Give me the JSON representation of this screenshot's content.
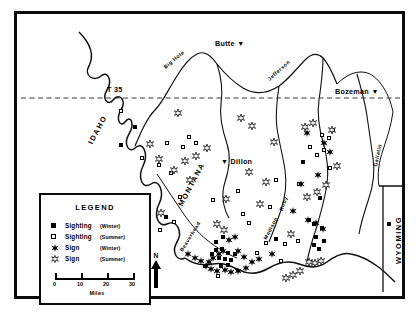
{
  "figure": {
    "type": "distribution-map",
    "region": "Southwestern Montana",
    "border_color": "#0b0b0b",
    "background_color": "#ffffff"
  },
  "cities": [
    {
      "name": "Butte",
      "marker": "triangle-down",
      "x": 212,
      "y": 38,
      "label_side": "left"
    },
    {
      "name": "Bozeman",
      "marker": "triangle-down",
      "x": 330,
      "y": 86,
      "label_side": "left"
    },
    {
      "name": "Dillon",
      "marker": "triangle-down",
      "x": 213,
      "y": 156,
      "label_side": "right"
    }
  ],
  "state_labels": [
    {
      "name": "IDAHO",
      "x": 74,
      "y": 140,
      "rotation": -62
    },
    {
      "name": "MONTANA",
      "x": 168,
      "y": 200,
      "rotation": -62
    },
    {
      "name": "WYOMING",
      "x": 382,
      "y": 205,
      "rotation": -90
    }
  ],
  "river_labels": [
    {
      "name": "Big Hole",
      "x": 152,
      "y": 46,
      "rotation": -40
    },
    {
      "name": "Jefferson",
      "x": 258,
      "y": 56,
      "rotation": -42
    },
    {
      "name": "Gallatin",
      "x": 360,
      "y": 140,
      "rotation": -78
    },
    {
      "name": "Ruby",
      "x": 264,
      "y": 186,
      "rotation": -72
    },
    {
      "name": "Madison",
      "x": 252,
      "y": 212,
      "rotation": -62
    },
    {
      "name": "Beaverhead",
      "x": 169,
      "y": 224,
      "rotation": -58
    }
  ],
  "annotations": [
    {
      "text": "T 35",
      "x": 101,
      "y": 83
    }
  ],
  "latitude_line": {
    "style": "dashed",
    "y": 96,
    "color": "#3a3a3a"
  },
  "legend": {
    "title": "LEGEND",
    "entries": [
      {
        "symbol": "filled-square",
        "name": "Sighting",
        "season": "(Winter)"
      },
      {
        "symbol": "open-square",
        "name": "Sighting",
        "season": "(Summer)"
      },
      {
        "symbol": "filled-star",
        "name": "Sign",
        "season": "(Winter)"
      },
      {
        "symbol": "open-star",
        "name": "Sign",
        "season": "(Summer)"
      }
    ],
    "scale": {
      "ticks": [
        "0",
        "10",
        "20",
        "30"
      ],
      "unit": "Miles"
    }
  },
  "north_arrow": {
    "label": "N"
  },
  "chart_data": {
    "type": "scatter",
    "xlabel": "",
    "ylabel": "",
    "series": [
      {
        "name": "Sighting (Winter)",
        "symbol": "filled-square",
        "points": [
          [
            118,
            113
          ],
          [
            104,
            131
          ],
          [
            127,
            186
          ],
          [
            149,
            203
          ],
          [
            96,
            208
          ],
          [
            123,
            216
          ],
          [
            206,
            223
          ],
          [
            199,
            228
          ],
          [
            199,
            236
          ],
          [
            205,
            235
          ],
          [
            211,
            239
          ],
          [
            218,
            240
          ],
          [
            195,
            240
          ],
          [
            202,
            244
          ],
          [
            208,
            245
          ],
          [
            214,
            246
          ],
          [
            211,
            251
          ],
          [
            204,
            252
          ],
          [
            286,
            148
          ],
          [
            303,
            184
          ],
          [
            297,
            210
          ],
          [
            305,
            214
          ],
          [
            299,
            223
          ],
          [
            307,
            227
          ],
          [
            302,
            235
          ],
          [
            297,
            231
          ],
          [
            259,
            225
          ],
          [
            372,
            210
          ],
          [
            316,
            116
          ]
        ]
      },
      {
        "name": "Sighting (Summer)",
        "symbol": "open-square",
        "points": [
          [
            104,
            97
          ],
          [
            150,
            129
          ],
          [
            125,
            144
          ],
          [
            142,
            151
          ],
          [
            166,
            133
          ],
          [
            172,
            123
          ],
          [
            163,
            183
          ],
          [
            196,
            186
          ],
          [
            221,
            177
          ],
          [
            226,
            200
          ],
          [
            253,
            193
          ],
          [
            240,
            239
          ],
          [
            264,
            247
          ],
          [
            282,
            170
          ],
          [
            293,
            133
          ],
          [
            300,
            141
          ],
          [
            307,
            136
          ],
          [
            312,
            124
          ],
          [
            305,
            121
          ],
          [
            313,
            154
          ],
          [
            292,
            206
          ],
          [
            259,
            166
          ],
          [
            179,
            129
          ],
          [
            154,
            159
          ],
          [
            188,
            252
          ],
          [
            201,
            262
          ],
          [
            249,
            229
          ],
          [
            268,
            230
          ],
          [
            281,
            227
          ],
          [
            232,
            209
          ],
          [
            157,
            208
          ],
          [
            143,
            216
          ],
          [
            105,
            232
          ]
        ]
      },
      {
        "name": "Sign (Winter)",
        "symbol": "filled-star",
        "points": [
          [
            305,
            121
          ],
          [
            311,
            130
          ],
          [
            299,
            153
          ],
          [
            289,
            198
          ],
          [
            297,
            201
          ],
          [
            304,
            207
          ],
          [
            210,
            218
          ],
          [
            216,
            215
          ],
          [
            200,
            232
          ],
          [
            204,
            229
          ],
          [
            194,
            236
          ],
          [
            190,
            240
          ],
          [
            187,
            244
          ],
          [
            192,
            247
          ],
          [
            198,
            249
          ],
          [
            206,
            248
          ],
          [
            212,
            250
          ],
          [
            219,
            249
          ],
          [
            227,
            246
          ],
          [
            233,
            240
          ],
          [
            240,
            237
          ],
          [
            253,
            232
          ],
          [
            219,
            229
          ],
          [
            225,
            235
          ],
          [
            169,
            232
          ],
          [
            176,
            236
          ],
          [
            182,
            239
          ],
          [
            274,
            189
          ],
          [
            282,
            162
          ],
          [
            288,
            111
          ]
        ]
      },
      {
        "name": "Sign (Summer)",
        "symbol": "open-star",
        "points": [
          [
            159,
            91
          ],
          [
            188,
            126
          ],
          [
            177,
            134
          ],
          [
            166,
            139
          ],
          [
            131,
            122
          ],
          [
            140,
            137
          ],
          [
            155,
            148
          ],
          [
            171,
            158
          ],
          [
            222,
            96
          ],
          [
            233,
            104
          ],
          [
            286,
            105
          ],
          [
            294,
            101
          ],
          [
            313,
            108
          ],
          [
            318,
            144
          ],
          [
            307,
            163
          ],
          [
            298,
            170
          ],
          [
            288,
            175
          ],
          [
            272,
            212
          ],
          [
            290,
            240
          ],
          [
            296,
            241
          ],
          [
            302,
            239
          ],
          [
            281,
            249
          ],
          [
            274,
            253
          ],
          [
            267,
            256
          ],
          [
            205,
            208
          ],
          [
            198,
            202
          ],
          [
            247,
            160
          ],
          [
            255,
            120
          ],
          [
            241,
            182
          ],
          [
            230,
            150
          ],
          [
            142,
            191
          ],
          [
            207,
            177
          ]
        ]
      }
    ]
  }
}
